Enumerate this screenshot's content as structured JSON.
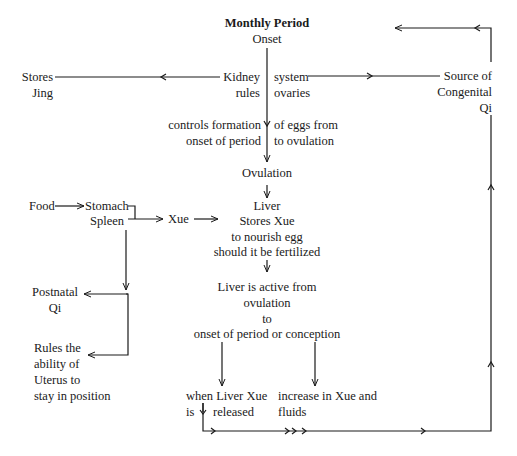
{
  "diagram": {
    "title": "Monthly Period",
    "nodes": {
      "onset": "Onset",
      "kidney": "Kidney",
      "rules": "rules",
      "system": "system",
      "ovaries": "ovaries",
      "stores_jing_1": "Stores",
      "stores_jing_2": "Jing",
      "source_1": "Source of",
      "source_2": "Congenital",
      "source_3": "Qi",
      "controls_1": "controls formation",
      "controls_2": "onset of period",
      "eggs_1": "of eggs from",
      "eggs_2": "to ovulation",
      "ovulation": "Ovulation",
      "food": "Food",
      "stomach": "Stomach",
      "spleen": "Spleen",
      "xue": "Xue",
      "liver_1": "Liver",
      "liver_2": "Stores Xue",
      "liver_3": "to nourish egg",
      "liver_4": "should it be fertilized",
      "postnatal_1": "Postnatal",
      "postnatal_2": "Qi",
      "active_1": "Liver is active from",
      "active_2": "ovulation",
      "active_3": "to",
      "active_4": "onset of period or conception",
      "uterus_1": "Rules the",
      "uterus_2": "ability of",
      "uterus_3": "Uterus to",
      "uterus_4": "stay in position",
      "when_1": "when Liver Xue",
      "when_2a": "is",
      "when_2b": "released",
      "increase_1": "increase in Xue and",
      "increase_2": "fluids"
    },
    "line_color": "#1a1a1a"
  }
}
